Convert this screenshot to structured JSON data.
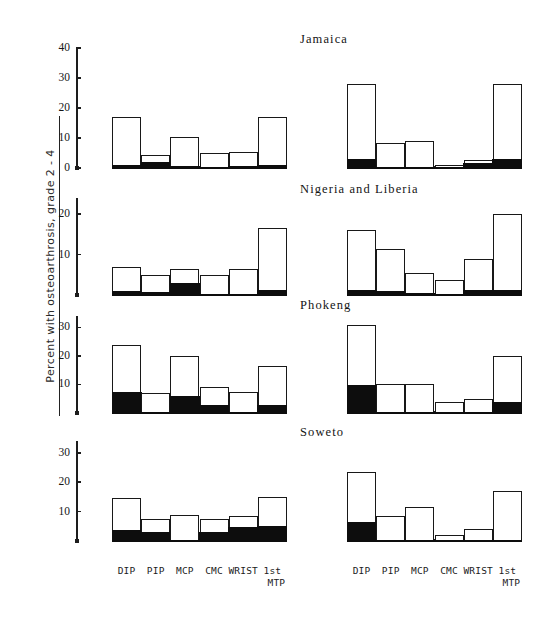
{
  "figure": {
    "ylabel": "Percent with osteoarthrosis, grade 2 - 4",
    "joints": [
      "DIP",
      "PIP",
      "MCP",
      "CMC",
      "WRIST",
      "1st",
      "MTP"
    ]
  },
  "xaxis": {
    "labels": [
      "DIP",
      "PIP",
      "MCP",
      "CMC",
      "WRIST",
      "1st"
    ],
    "last_label_line2": "MTP"
  },
  "chart_data": {
    "type": "bar",
    "xlabel": "",
    "ylabel": "Percent with osteoarthrosis, grade 2 - 4",
    "grid": false,
    "legend": "none",
    "categories": [
      "DIP",
      "PIP",
      "MCP",
      "CMC",
      "WRIST",
      "1st MTP"
    ],
    "note": "Each bar: open box = total percent grade 2-4; solid black portion at base = severe subset. Two sub-panels per population (left and right groups).",
    "panels": [
      {
        "name": "Jamaica",
        "ylim": [
          0,
          40
        ],
        "yticks": [
          0,
          10,
          20,
          30,
          40
        ],
        "groups": [
          {
            "side": "left",
            "series": [
              {
                "name": "total",
                "values": [
                  17.0,
                  4.5,
                  10.3,
                  5.0,
                  5.2,
                  17.0
                ]
              },
              {
                "name": "severe",
                "values": [
                  1.3,
                  2.3,
                  1.0,
                  0.5,
                  1.0,
                  1.2
                ]
              }
            ]
          },
          {
            "side": "right",
            "series": [
              {
                "name": "total",
                "values": [
                  28.0,
                  8.5,
                  9.0,
                  1.0,
                  2.8,
                  28.0
                ]
              },
              {
                "name": "severe",
                "values": [
                  3.3,
                  0.6,
                  0.5,
                  0.3,
                  2.0,
                  3.2
                ]
              }
            ]
          }
        ]
      },
      {
        "name": "Nigeria and Liberia",
        "ylim": [
          0,
          24
        ],
        "yticks": [
          10,
          20
        ],
        "groups": [
          {
            "side": "left",
            "series": [
              {
                "name": "total",
                "values": [
                  7.0,
                  5.0,
                  6.5,
                  5.0,
                  6.5,
                  16.5
                ]
              },
              {
                "name": "severe",
                "values": [
                  1.2,
                  0.9,
                  3.2,
                  0.3,
                  0.4,
                  1.4
                ]
              }
            ]
          },
          {
            "side": "right",
            "series": [
              {
                "name": "total",
                "values": [
                  16.0,
                  11.5,
                  5.5,
                  3.8,
                  9.0,
                  20.0
                ]
              },
              {
                "name": "severe",
                "values": [
                  1.3,
                  1.0,
                  0.5,
                  0.4,
                  1.4,
                  1.4
                ]
              }
            ]
          }
        ]
      },
      {
        "name": "Phokeng",
        "ylim": [
          0,
          34
        ],
        "yticks": [
          10,
          20,
          30
        ],
        "groups": [
          {
            "side": "left",
            "series": [
              {
                "name": "total",
                "values": [
                  24.0,
                  7.0,
                  20.0,
                  9.0,
                  7.5,
                  16.5
                ]
              },
              {
                "name": "severe",
                "values": [
                  7.5,
                  0.3,
                  6.0,
                  3.0,
                  0.3,
                  3.0
                ]
              }
            ]
          },
          {
            "side": "right",
            "series": [
              {
                "name": "total",
                "values": [
                  31.0,
                  10.0,
                  10.0,
                  4.0,
                  5.0,
                  20.0
                ]
              },
              {
                "name": "severe",
                "values": [
                  10.0,
                  0.3,
                  0.3,
                  0.3,
                  0.4,
                  4.0
                ]
              }
            ]
          }
        ]
      },
      {
        "name": "Soweto",
        "ylim": [
          0,
          34
        ],
        "yticks": [
          10,
          20,
          30
        ],
        "groups": [
          {
            "side": "left",
            "series": [
              {
                "name": "total",
                "values": [
                  14.5,
                  7.5,
                  9.0,
                  7.5,
                  8.5,
                  15.0
                ]
              },
              {
                "name": "severe",
                "values": [
                  4.0,
                  3.2,
                  0.6,
                  3.2,
                  5.0,
                  5.2
                ]
              }
            ]
          },
          {
            "side": "right",
            "series": [
              {
                "name": "total",
                "values": [
                  23.5,
                  8.5,
                  11.5,
                  2.0,
                  4.0,
                  17.0
                ]
              },
              {
                "name": "severe",
                "values": [
                  6.5,
                  0.4,
                  0.4,
                  0.6,
                  0.5,
                  0.6
                ]
              }
            ]
          }
        ]
      }
    ]
  },
  "layout": {
    "panel_tops": [
      40,
      190,
      305,
      430
    ],
    "axis_geom": [
      {
        "top": 48,
        "bottom": 168
      },
      {
        "top": 198,
        "bottom": 295
      },
      {
        "top": 316,
        "bottom": 413
      },
      {
        "top": 441,
        "bottom": 541
      }
    ]
  }
}
